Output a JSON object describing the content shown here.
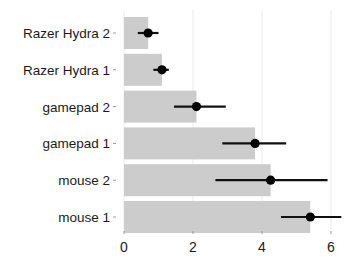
{
  "chart_data": {
    "type": "bar",
    "orientation": "horizontal",
    "title": "",
    "xlabel": "",
    "ylabel": "",
    "categories": [
      "Razer Hydra 2",
      "Razer Hydra 1",
      "gamepad 2",
      "gamepad 1",
      "mouse 2",
      "mouse 1"
    ],
    "values": [
      0.7,
      1.1,
      2.1,
      3.8,
      4.25,
      5.4
    ],
    "error_low": [
      0.4,
      0.85,
      1.45,
      2.85,
      2.65,
      4.55
    ],
    "error_high": [
      1.0,
      1.3,
      2.95,
      4.7,
      5.9,
      6.3
    ],
    "xlim": [
      0,
      6.8
    ],
    "xticks": [
      0,
      2,
      4,
      6
    ],
    "grid": true,
    "legend": null,
    "colors": {
      "bar": "#cccccc",
      "point": "#000000",
      "errorbar": "#111111",
      "grid": "#ebebeb",
      "tick": "#999999"
    }
  }
}
